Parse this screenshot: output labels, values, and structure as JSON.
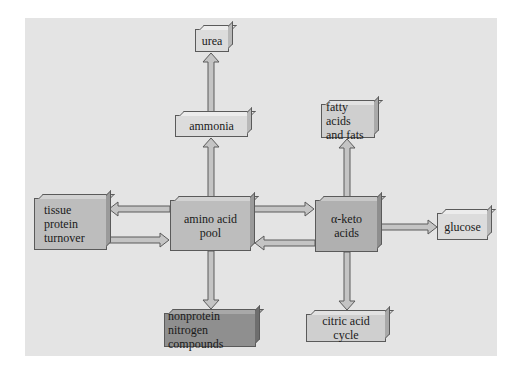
{
  "diagram": {
    "type": "flowchart",
    "nodes": [
      {
        "id": "urea",
        "label": "urea"
      },
      {
        "id": "ammonia",
        "label": "ammonia"
      },
      {
        "id": "fatty_acids",
        "label_line1": "fatty acids",
        "label_line2": "and fats"
      },
      {
        "id": "tissue_protein",
        "label_line1": "tissue protein",
        "label_line2": "turnover"
      },
      {
        "id": "amino_acid_pool",
        "label": "amino acid pool"
      },
      {
        "id": "alpha_keto",
        "label": "α-keto acids"
      },
      {
        "id": "glucose",
        "label": "glucose"
      },
      {
        "id": "nonprotein",
        "label_line1": "nonprotein",
        "label_line2": "nitrogen compounds"
      },
      {
        "id": "citric_acid",
        "label": "citric acid cycle"
      }
    ],
    "edges": [
      {
        "from": "ammonia",
        "to": "urea"
      },
      {
        "from": "amino_acid_pool",
        "to": "ammonia"
      },
      {
        "from": "amino_acid_pool",
        "to": "tissue_protein"
      },
      {
        "from": "tissue_protein",
        "to": "amino_acid_pool"
      },
      {
        "from": "amino_acid_pool",
        "to": "alpha_keto"
      },
      {
        "from": "alpha_keto",
        "to": "amino_acid_pool"
      },
      {
        "from": "alpha_keto",
        "to": "fatty_acids"
      },
      {
        "from": "alpha_keto",
        "to": "glucose"
      },
      {
        "from": "amino_acid_pool",
        "to": "nonprotein"
      },
      {
        "from": "alpha_keto",
        "to": "citric_acid"
      }
    ],
    "colors": {
      "panel": "#e4e4e4",
      "arrow_fill": "#c4c4c4",
      "arrow_stroke": "#5a5a5a"
    }
  }
}
